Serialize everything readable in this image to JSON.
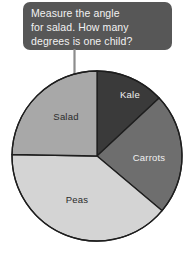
{
  "callout": {
    "name": "instruction-callout",
    "background_color": "#575757",
    "text_color": "#f2f2f2",
    "lines": [
      "Measure the angle",
      "for salad. How many",
      "degrees is one child?"
    ],
    "full_text": "Measure the angle for salad. How many degrees is one child?"
  },
  "pointer": {
    "name": "down-arrow-icon",
    "color": "#8c8c8c",
    "points_to": "Salad"
  },
  "chart_data": {
    "type": "pie",
    "title": "",
    "xlabel": "",
    "ylabel": "",
    "legend_position": "none",
    "labels_inside": true,
    "start_angle_deg": 0,
    "direction": "clockwise",
    "center": {
      "x": 97,
      "y": 90
    },
    "radius": 85,
    "outline_color": "#1e1e1e",
    "categories": [
      "Kale",
      "Carrots",
      "Peas",
      "Salad"
    ],
    "angles_deg": [
      47,
      83,
      141,
      89
    ],
    "values": [
      47,
      83,
      141,
      89
    ],
    "slices": [
      {
        "label": "Kale",
        "angle_deg": 47,
        "start_deg": 0,
        "end_deg": 47,
        "color": "#3a3a3a",
        "label_color": "#f0f0f0",
        "label_x": 122,
        "label_y": 32
      },
      {
        "label": "Carrots",
        "angle_deg": 83,
        "start_deg": 47,
        "end_deg": 130,
        "color": "#6e6e6e",
        "label_color": "#f0f0f0",
        "label_x": 141,
        "label_y": 95
      },
      {
        "label": "Peas",
        "angle_deg": 141,
        "start_deg": 130,
        "end_deg": 271,
        "color": "#d4d4d4",
        "label_color": "#2b2b2b",
        "label_x": 69,
        "label_y": 137
      },
      {
        "label": "Salad",
        "angle_deg": 89,
        "start_deg": 271,
        "end_deg": 360,
        "color": "#a8a8a8",
        "label_color": "#2b2b2b",
        "label_x": 58,
        "label_y": 54
      }
    ]
  }
}
